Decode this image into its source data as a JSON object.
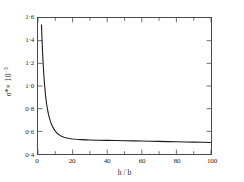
{
  "figure": {
    "background_color": "#ffffff",
    "frame_color": "#4a4a4a",
    "curve_color": "#1a1a1a"
  },
  "axes": {
    "x": {
      "title": "h / b",
      "min": 0,
      "max": 100,
      "tick_labels": [
        "0",
        "20",
        "40",
        "60",
        "80",
        "100"
      ],
      "tick_values": [
        0,
        20,
        40,
        60,
        80,
        100
      ],
      "minor_tick_values": [
        10,
        30,
        50,
        70,
        90
      ]
    },
    "y": {
      "title_main": "σ*",
      "title_mult": "× 10",
      "title_exp": "−3",
      "min": 0.4,
      "max": 1.6,
      "tick_labels": [
        "1·6",
        "1·4",
        "1·2",
        "1·0",
        "0·8",
        "0·6",
        "0·4"
      ],
      "tick_values": [
        1.6,
        1.4,
        1.2,
        1.0,
        0.8,
        0.6,
        0.4
      ]
    }
  },
  "chart_data": {
    "type": "line",
    "title": "",
    "subtitle": "",
    "xlabel": "h / b",
    "ylabel": "σ* × 10⁻³",
    "xlim": [
      0,
      100
    ],
    "ylim": [
      0.4,
      1.6
    ],
    "grid": false,
    "legend": null,
    "annotations": [],
    "series": [
      {
        "name": "sigma-star",
        "x": [
          2.0,
          2.3,
          2.6,
          3.0,
          3.4,
          3.8,
          4.2,
          4.6,
          5.0,
          5.5,
          6.0,
          6.5,
          7.0,
          7.5,
          8.0,
          9.0,
          10.0,
          11.0,
          12.0,
          13.0,
          14.0,
          15.0,
          16.0,
          18.0,
          20.0,
          22.0,
          25.0,
          28.0,
          30.0,
          35.0,
          40.0,
          45.0,
          50.0,
          55.0,
          60.0,
          65.0,
          70.0,
          75.0,
          80.0,
          85.0,
          90.0,
          95.0,
          100.0
        ],
        "y": [
          1.54,
          1.42,
          1.31,
          1.19,
          1.09,
          1.01,
          0.94,
          0.885,
          0.84,
          0.793,
          0.755,
          0.723,
          0.697,
          0.674,
          0.655,
          0.624,
          0.602,
          0.585,
          0.572,
          0.562,
          0.5545,
          0.5485,
          0.5435,
          0.5365,
          0.5325,
          0.5295,
          0.5265,
          0.5245,
          0.5235,
          0.5215,
          0.52,
          0.5185,
          0.517,
          0.5155,
          0.514,
          0.5125,
          0.511,
          0.5095,
          0.508,
          0.5065,
          0.505,
          0.5035,
          0.502
        ]
      }
    ]
  }
}
